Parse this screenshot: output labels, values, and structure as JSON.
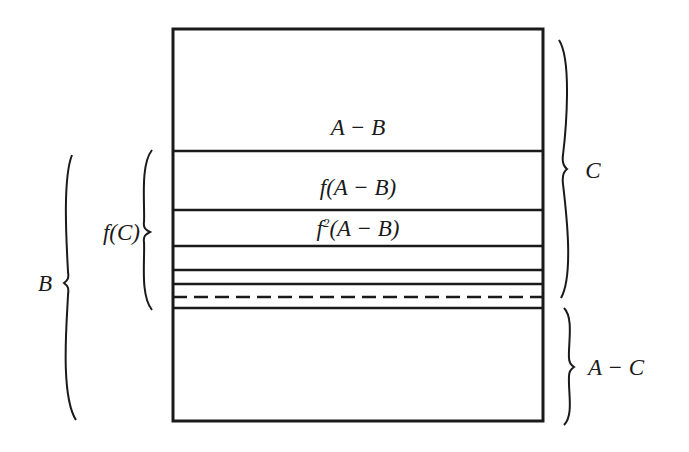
{
  "diagram": {
    "type": "set-decomposition",
    "stroke_color": "#1a1a1a",
    "background": "#ffffff",
    "box": {
      "x": 173,
      "y": 29,
      "width": 370,
      "height": 392
    },
    "region_labels": {
      "a_minus_b": "A − B",
      "f_a_minus_b": "f(A − B)",
      "f2_prefix": "f",
      "f2_exponent": "2",
      "f2_suffix": "(A − B)"
    },
    "dividers": [
      {
        "y": 151,
        "style": "solid"
      },
      {
        "y": 210,
        "style": "solid"
      },
      {
        "y": 246,
        "style": "solid"
      },
      {
        "y": 270,
        "style": "solid"
      },
      {
        "y": 284,
        "style": "solid"
      },
      {
        "y": 297,
        "style": "dashed"
      },
      {
        "y": 308,
        "style": "solid"
      }
    ],
    "braces": {
      "B": {
        "label": "B",
        "side": "left",
        "y_top": 155,
        "y_bottom": 420
      },
      "fC": {
        "label": "f(C)",
        "side": "left",
        "y_top": 150,
        "y_bottom": 310
      },
      "C": {
        "label": "C",
        "side": "right",
        "y_top": 40,
        "y_bottom": 298
      },
      "A_minus_C": {
        "label": "A − C",
        "side": "right",
        "y_top": 308,
        "y_bottom": 425
      }
    }
  }
}
